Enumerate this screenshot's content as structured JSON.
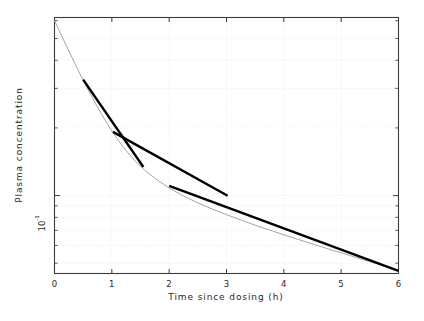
{
  "chart_data": {
    "type": "line",
    "title": "",
    "xlabel": "Time since dosing (h)",
    "ylabel": "Plasma concentration",
    "xlim": [
      0,
      6
    ],
    "ylim": [
      0.045,
      0.62
    ],
    "yscale": "log",
    "xscale": "linear",
    "grid": true,
    "legend": null,
    "x_ticks": [
      "0",
      "1",
      "2",
      "3",
      "4",
      "5",
      "6"
    ],
    "x_tick_values": [
      0,
      1,
      2,
      3,
      4,
      5,
      6
    ],
    "y_tick_labels": [
      "10",
      "-1"
    ],
    "y_tick_label_text": "10-1",
    "y_tick_values": [
      0.1
    ],
    "series": [
      {
        "name": "plasma concentration curve",
        "style": "thin-grey-line",
        "color": "#9a9a9a",
        "x": [
          0,
          0.1,
          0.2,
          0.3,
          0.4,
          0.5,
          0.6,
          0.7,
          0.8,
          0.9,
          1.0,
          1.2,
          1.4,
          1.6,
          1.8,
          2.0,
          2.25,
          2.5,
          2.75,
          3.0,
          3.5,
          4.0,
          4.5,
          5.0,
          5.5,
          6.0
        ],
        "y": [
          0.6,
          0.53,
          0.468,
          0.414,
          0.367,
          0.326,
          0.291,
          0.261,
          0.235,
          0.213,
          0.194,
          0.164,
          0.143,
          0.128,
          0.117,
          0.108,
          0.0996,
          0.0928,
          0.0871,
          0.0822,
          0.0738,
          0.0669,
          0.0609,
          0.0556,
          0.0508,
          0.0465
        ]
      },
      {
        "name": "tangent segment A (terminal slope, early portion)",
        "style": "thick-black-segment",
        "color": "#000000",
        "x": [
          0.5,
          1.55
        ],
        "y": [
          0.328,
          0.134
        ]
      },
      {
        "name": "tangent segment B (residual slope)",
        "style": "thick-black-segment",
        "color": "#000000",
        "x": [
          1.02,
          3.02
        ],
        "y": [
          0.192,
          0.0998
        ]
      },
      {
        "name": "tangent segment C (terminal elimination slope)",
        "style": "thick-black-segment",
        "color": "#000000",
        "x": [
          2.0,
          6.0
        ],
        "y": [
          0.1105,
          0.0462
        ]
      }
    ]
  },
  "axes": {
    "x_title": "Time since dosing (h)",
    "y_title": "Plasma concentration",
    "y_tick_base": "10",
    "y_tick_exponent": "-1",
    "x_tick_0": "0",
    "x_tick_1": "1",
    "x_tick_2": "2",
    "x_tick_3": "3",
    "x_tick_4": "4",
    "x_tick_5": "5",
    "x_tick_6": "6"
  },
  "colors": {
    "curve": "#9a9a9a",
    "tangent": "#000000",
    "frame": "#3c3c3c",
    "grid": "#d8d8d8",
    "background": "#ffffff"
  }
}
